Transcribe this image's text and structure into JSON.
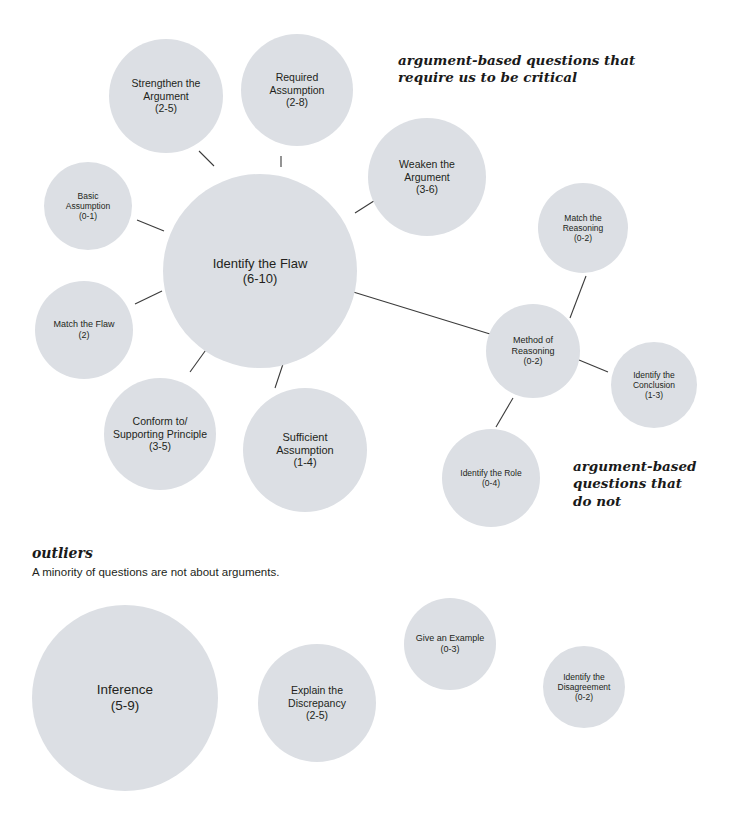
{
  "diagram": {
    "type": "bubble-map",
    "bubble_fill": "#dcdfe4",
    "connector_color": "#3b3b3b",
    "annotations": [
      {
        "id": "annot-critical",
        "text": "argument-based questions that\nrequire us to be critical",
        "x": 398,
        "y": 52,
        "font_size": 13.5
      },
      {
        "id": "annot-do-not",
        "text": "argument-based\nquestions that\ndo not",
        "x": 573,
        "y": 458,
        "font_size": 13.5
      }
    ],
    "sections": [
      {
        "id": "outliers",
        "heading": "outliers",
        "subtitle": "A minority of questions are not about arguments.",
        "heading_x": 32,
        "heading_y": 545,
        "sub_x": 32,
        "sub_y": 566
      }
    ],
    "bubbles": [
      {
        "id": "strengthen-the-argument",
        "label": "Strengthen the\nArgument\n(2-5)",
        "cx": 166,
        "cy": 96,
        "r": 57,
        "font_size": 10.5,
        "group": "critical"
      },
      {
        "id": "required-assumption",
        "label": "Required\nAssumption\n(2-8)",
        "cx": 297,
        "cy": 90,
        "r": 56,
        "font_size": 10.5,
        "group": "critical"
      },
      {
        "id": "weaken-the-argument",
        "label": "Weaken the\nArgument\n(3-6)",
        "cx": 427,
        "cy": 177,
        "r": 59,
        "font_size": 10.5,
        "group": "critical"
      },
      {
        "id": "basic-assumption",
        "label": "Basic\nAssumption\n(0-1)",
        "cx": 88,
        "cy": 206,
        "r": 44,
        "font_size": 8.5,
        "group": "critical"
      },
      {
        "id": "identify-the-flaw",
        "label": "Identify the Flaw\n(6-10)",
        "cx": 260,
        "cy": 271,
        "r": 97,
        "font_size": 13,
        "group": "critical"
      },
      {
        "id": "match-the-reasoning",
        "label": "Match the\nReasoning\n(0-2)",
        "cx": 583,
        "cy": 228,
        "r": 45,
        "font_size": 8.5,
        "group": "not-critical"
      },
      {
        "id": "match-the-flaw",
        "label": "Match the Flaw\n(2)",
        "cx": 84,
        "cy": 330,
        "r": 49,
        "font_size": 9,
        "group": "critical"
      },
      {
        "id": "method-of-reasoning",
        "label": "Method of\nReasoning\n(0-2)",
        "cx": 533,
        "cy": 351,
        "r": 47,
        "font_size": 9,
        "group": "not-critical"
      },
      {
        "id": "identify-the-conclusion",
        "label": "Identify the\nConclusion\n(1-3)",
        "cx": 654,
        "cy": 385,
        "r": 43,
        "font_size": 8.5,
        "group": "not-critical"
      },
      {
        "id": "conform-to-supporting-principle",
        "label": "Conform to/\nSupporting Principle\n(3-5)",
        "cx": 160,
        "cy": 434,
        "r": 56,
        "font_size": 10.5,
        "group": "critical"
      },
      {
        "id": "sufficient-assumption",
        "label": "Sufficient\nAssumption\n(1-4)",
        "cx": 305,
        "cy": 450,
        "r": 62,
        "font_size": 11,
        "group": "critical"
      },
      {
        "id": "identify-the-role",
        "label": "Identify the Role\n(0-4)",
        "cx": 491,
        "cy": 478,
        "r": 49,
        "font_size": 8.5,
        "group": "not-critical"
      },
      {
        "id": "inference",
        "label": "Inference\n(5-9)",
        "cx": 125,
        "cy": 698,
        "r": 93,
        "font_size": 13.5,
        "group": "outlier"
      },
      {
        "id": "explain-the-discrepancy",
        "label": "Explain the\nDiscrepancy\n(2-5)",
        "cx": 317,
        "cy": 703,
        "r": 59,
        "font_size": 10.5,
        "group": "outlier"
      },
      {
        "id": "give-an-example",
        "label": "Give an Example\n(0-3)",
        "cx": 450,
        "cy": 644,
        "r": 46,
        "font_size": 9,
        "group": "outlier"
      },
      {
        "id": "identify-the-disagreement",
        "label": "Identify the\nDisagreement\n(0-2)",
        "cx": 584,
        "cy": 687,
        "r": 41,
        "font_size": 8.5,
        "group": "outlier"
      }
    ],
    "connectors": [
      {
        "id": "flaw-to-strengthen",
        "x1": 214,
        "y1": 166,
        "x2": 199,
        "y2": 151
      },
      {
        "id": "flaw-to-required",
        "x1": 281,
        "y1": 167,
        "x2": 281,
        "y2": 156
      },
      {
        "id": "flaw-to-weaken",
        "x1": 355,
        "y1": 213,
        "x2": 377,
        "y2": 199
      },
      {
        "id": "flaw-to-basic",
        "x1": 137,
        "y1": 220,
        "x2": 164,
        "y2": 231
      },
      {
        "id": "flaw-to-match-flaw",
        "x1": 135,
        "y1": 304,
        "x2": 162,
        "y2": 291
      },
      {
        "id": "flaw-to-conform",
        "x1": 190,
        "y1": 372,
        "x2": 208,
        "y2": 347
      },
      {
        "id": "flaw-to-sufficient",
        "x1": 275,
        "y1": 388,
        "x2": 283,
        "y2": 364
      },
      {
        "id": "flaw-to-method",
        "x1": 350,
        "y1": 291,
        "x2": 490,
        "y2": 334
      },
      {
        "id": "method-to-match-reasoning",
        "x1": 570,
        "y1": 318,
        "x2": 586,
        "y2": 276
      },
      {
        "id": "method-to-conclusion",
        "x1": 579,
        "y1": 360,
        "x2": 608,
        "y2": 372
      },
      {
        "id": "method-to-role",
        "x1": 513,
        "y1": 398,
        "x2": 496,
        "y2": 427
      }
    ]
  }
}
